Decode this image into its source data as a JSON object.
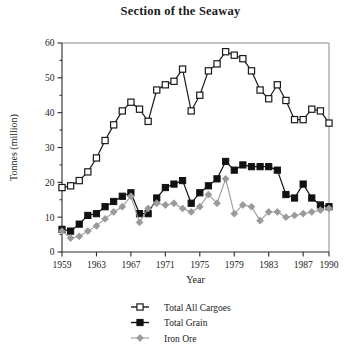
{
  "chart_data": {
    "type": "line",
    "title": "Section of the Seaway",
    "xlabel": "Year",
    "ylabel": "Tonnes (million)",
    "xlim": [
      1959,
      1990
    ],
    "ylim": [
      0,
      60
    ],
    "grid": false,
    "legend_position": "bottom-center",
    "xticks": [
      "1959",
      "1963",
      "1967",
      "1971",
      "1975",
      "1979",
      "1983",
      "1987",
      "1990"
    ],
    "xtick_values": [
      1959,
      1963,
      1967,
      1971,
      1975,
      1979,
      1983,
      1987,
      1990
    ],
    "yticks": [
      "0",
      "10",
      "20",
      "30",
      "40",
      "50",
      "60"
    ],
    "ytick_values": [
      0,
      10,
      20,
      30,
      40,
      50,
      60
    ],
    "x": [
      1959,
      1960,
      1961,
      1962,
      1963,
      1964,
      1965,
      1966,
      1967,
      1968,
      1969,
      1970,
      1971,
      1972,
      1973,
      1974,
      1975,
      1976,
      1977,
      1978,
      1979,
      1980,
      1981,
      1982,
      1983,
      1984,
      1985,
      1986,
      1987,
      1988,
      1989,
      1990
    ],
    "series": [
      {
        "name": "Total All Cargoes",
        "marker": "open-square",
        "color": "#1a1a1a",
        "values": [
          18.5,
          19.0,
          20.5,
          23.0,
          27.0,
          32.0,
          36.5,
          40.5,
          43.0,
          41.0,
          37.5,
          46.5,
          48.0,
          49.0,
          52.5,
          40.5,
          45.0,
          52.0,
          54.0,
          57.5,
          56.5,
          55.5,
          52.0,
          46.5,
          44.0,
          48.0,
          43.5,
          38.0,
          38.0,
          41.0,
          40.5,
          37.0
        ]
      },
      {
        "name": "Total Grain",
        "marker": "filled-square",
        "color": "#111111",
        "values": [
          6.5,
          6.0,
          8.0,
          10.5,
          11.0,
          13.0,
          14.5,
          16.0,
          17.0,
          11.0,
          11.0,
          15.5,
          18.5,
          19.5,
          20.5,
          14.0,
          17.0,
          19.0,
          21.0,
          26.0,
          23.5,
          25.0,
          24.5,
          24.5,
          24.5,
          23.5,
          16.5,
          15.5,
          19.5,
          15.5,
          13.5,
          13.0
        ]
      },
      {
        "name": "Iron Ore",
        "marker": "diamond",
        "color": "#9a9a9a",
        "values": [
          6.0,
          4.0,
          4.5,
          6.0,
          7.5,
          9.5,
          11.5,
          13.0,
          16.0,
          8.5,
          12.5,
          14.0,
          13.5,
          14.0,
          12.5,
          11.5,
          13.0,
          16.5,
          14.0,
          21.0,
          11.0,
          13.5,
          13.0,
          9.0,
          11.5,
          11.5,
          10.0,
          10.5,
          11.0,
          11.5,
          12.0,
          12.5
        ]
      }
    ]
  }
}
